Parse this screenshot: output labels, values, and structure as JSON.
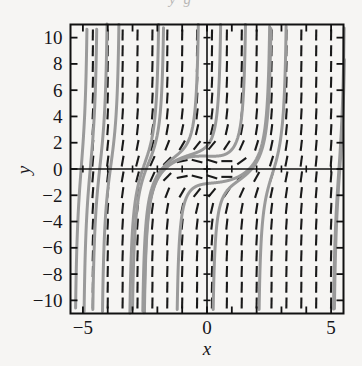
{
  "figure": {
    "top_fragment": "y g",
    "background_color": "#f6f5f3",
    "frame_color": "#111111",
    "tick_color": "#111111",
    "field_color": "#1a1a1a",
    "curve_color": "#9a9a9a"
  },
  "chart_data": {
    "type": "line",
    "title": "",
    "subtitle": "",
    "xlabel": "x",
    "ylabel": "y",
    "xlim": [
      -5.5,
      5.5
    ],
    "ylim": [
      -11,
      11
    ],
    "grid": false,
    "legend": "none",
    "plot_kind": "direction-field-with-solution-curves",
    "equation": "dy/dx = x^2 + y^2 - 1",
    "x_ticks": [
      -5,
      -4,
      -3,
      -2,
      -1,
      0,
      1,
      2,
      3,
      4,
      5
    ],
    "x_ticklabels": [
      "-5",
      "",
      "",
      "",
      "",
      "0",
      "",
      "",
      "",
      "",
      "5"
    ],
    "y_ticks": [
      -10,
      -8,
      -6,
      -4,
      -2,
      0,
      2,
      4,
      6,
      8,
      10
    ],
    "y_ticklabels": [
      "-10",
      "-8",
      "-6",
      "-4",
      "-2",
      "0",
      "2",
      "4",
      "6",
      "8",
      "10"
    ],
    "axis_lines": {
      "x_axis_at_y": 0,
      "y_axis_at_x": 0
    },
    "field": {
      "description": "slope marks on a grid; slope = x^2 + y^2 - 1",
      "x_grid": [
        -4.6,
        -4.0,
        -3.4,
        -2.8,
        -2.2,
        -1.6,
        -1.0,
        -0.4,
        0.2,
        0.8,
        1.4,
        2.0,
        2.6,
        3.2,
        3.8,
        4.4,
        5.0
      ],
      "y_grid": [
        -10.2,
        -9.0,
        -7.8,
        -6.6,
        -5.4,
        -4.2,
        -3.0,
        -1.8,
        -0.6,
        0.6,
        1.8,
        3.0,
        4.2,
        5.4,
        6.6,
        7.8,
        9.0,
        10.2
      ],
      "mark_length_px": 11
    },
    "solution_curves": [
      {
        "name": "curve-1",
        "x0": -4.85,
        "y0": 9.2
      },
      {
        "name": "curve-2",
        "x0": -3.55,
        "y0": 11.0
      },
      {
        "name": "curve-3",
        "x0": -1.95,
        "y0": 11.0
      },
      {
        "name": "curve-4",
        "x0": -0.35,
        "y0": 11.0
      },
      {
        "name": "curve-5",
        "x0": 0.55,
        "y0": 11.0
      },
      {
        "name": "curve-6",
        "x0": 1.55,
        "y0": 11.0
      },
      {
        "name": "curve-7",
        "x0": 5.45,
        "y0": 4.5
      },
      {
        "name": "curve-8",
        "x0": 5.45,
        "y0": 3.1
      },
      {
        "name": "curve-9",
        "x0": -4.9,
        "y0": -6.1
      },
      {
        "name": "curve-10",
        "x0": -4.6,
        "y0": -10.7
      },
      {
        "name": "curve-11",
        "x0": -3.0,
        "y0": -10.7
      },
      {
        "name": "curve-12",
        "x0": -1.2,
        "y0": -10.7
      },
      {
        "name": "curve-13",
        "x0": 0.25,
        "y0": -10.7
      },
      {
        "name": "curve-14",
        "x0": 2.1,
        "y0": -10.7
      }
    ]
  }
}
